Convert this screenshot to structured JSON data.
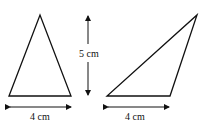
{
  "diagram": {
    "left_triangle": {
      "base_label": "4 cm",
      "vertices": [
        [
          9,
          96
        ],
        [
          40,
          15
        ],
        [
          71,
          96
        ]
      ]
    },
    "right_triangle": {
      "base_label": "4 cm",
      "vertices": [
        [
          107,
          96
        ],
        [
          170,
          96
        ],
        [
          197,
          15
        ]
      ]
    },
    "height_arrow": {
      "label": "5 cm"
    },
    "colors": {
      "stroke": "#111111",
      "background": "#ffffff"
    }
  }
}
